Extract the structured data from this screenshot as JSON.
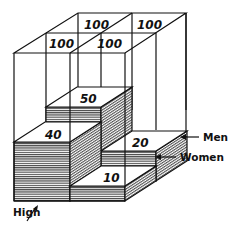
{
  "diagram": {
    "title": "",
    "type": "3d-block-diagram",
    "cells_top": [
      {
        "id": "back-high",
        "value": "100"
      },
      {
        "id": "back-low",
        "value": "100"
      },
      {
        "id": "front-high",
        "value": "100"
      },
      {
        "id": "front-low",
        "value": "100"
      }
    ],
    "blocks": [
      {
        "income": "High",
        "gender": "Men",
        "value": "50"
      },
      {
        "income": "High",
        "gender": "Women",
        "value": "40"
      },
      {
        "income": "Low",
        "gender": "Men",
        "value": "20"
      },
      {
        "income": "Low",
        "gender": "Women",
        "value": "10"
      }
    ],
    "labels": {
      "men": "Men",
      "women": "Women",
      "high_line1": "High",
      "high_line2": "Income",
      "low_line1": "Low",
      "low_line2": "Income"
    },
    "colors": {
      "ink": "#111111",
      "background": "#ffffff"
    }
  }
}
